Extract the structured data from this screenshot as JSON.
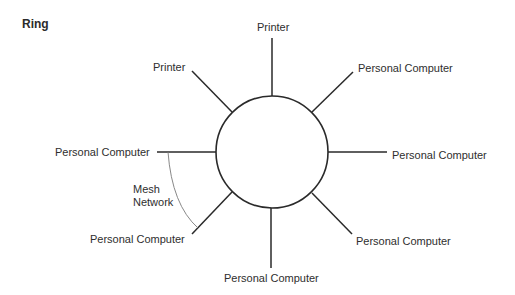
{
  "diagram": {
    "title": "Ring",
    "type": "ring-network-topology",
    "center_node": "ring",
    "nodes": [
      {
        "id": "n_top",
        "label": "Printer",
        "position": "top"
      },
      {
        "id": "n_top_left",
        "label": "Printer",
        "position": "top-left"
      },
      {
        "id": "n_top_right",
        "label": "Personal Computer",
        "position": "top-right"
      },
      {
        "id": "n_left",
        "label": "Personal Computer",
        "position": "left"
      },
      {
        "id": "n_right",
        "label": "Personal Computer",
        "position": "right"
      },
      {
        "id": "n_bottom_left",
        "label": "Personal Computer",
        "position": "bottom-left"
      },
      {
        "id": "n_bottom_right",
        "label": "Personal Computer",
        "position": "bottom-right"
      },
      {
        "id": "n_bottom",
        "label": "Personal Computer",
        "position": "bottom"
      }
    ],
    "annotation": {
      "line1": "Mesh",
      "line2": "Network",
      "connects": [
        "n_left",
        "n_bottom_left"
      ]
    },
    "colors": {
      "line": "#2a2a2a",
      "mesh_arc": "#7a7a7a",
      "text": "#2e2e2e"
    }
  }
}
